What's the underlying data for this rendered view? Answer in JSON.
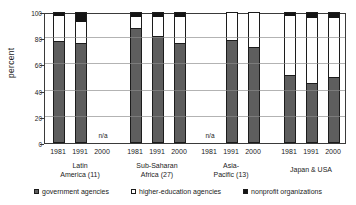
{
  "chart_data": {
    "type": "bar",
    "stacked": true,
    "ylabel": "percent",
    "ylim": [
      0,
      100
    ],
    "yticks": [
      0,
      20,
      40,
      60,
      80,
      100
    ],
    "grid": "horizontal",
    "legend_position": "bottom",
    "na_label": "n/a",
    "legend": [
      {
        "name": "government agencies",
        "color": "#5e5e5e"
      },
      {
        "name": "higher-education agencies",
        "color": "#ffffff"
      },
      {
        "name": "nonprofit organizations",
        "color": "#141414"
      }
    ],
    "series_order": [
      "government agencies",
      "higher-education agencies",
      "nonprofit organizations"
    ],
    "groups": [
      {
        "label_lines": [
          "Latin",
          "America (11)"
        ],
        "bars": [
          {
            "year": "1981",
            "government": 78,
            "higher_education": 20,
            "nonprofit": 2
          },
          {
            "year": "1991",
            "government": 76,
            "higher_education": 17,
            "nonprofit": 7
          },
          {
            "year": "2000",
            "na": true
          }
        ]
      },
      {
        "label_lines": [
          "Sub-Saharan",
          "Africa (27)"
        ],
        "bars": [
          {
            "year": "1981",
            "government": 88,
            "higher_education": 9,
            "nonprofit": 3
          },
          {
            "year": "1991",
            "government": 82,
            "higher_education": 15,
            "nonprofit": 3
          },
          {
            "year": "2000",
            "government": 76,
            "higher_education": 21,
            "nonprofit": 3
          }
        ]
      },
      {
        "label_lines": [
          "Asia-",
          "Pacific (13)"
        ],
        "bars": [
          {
            "year": "1981",
            "na": true
          },
          {
            "year": "1991",
            "government": 79,
            "higher_education": 21,
            "nonprofit": 0
          },
          {
            "year": "2000",
            "government": 73,
            "higher_education": 27,
            "nonprofit": 0
          }
        ]
      },
      {
        "label_lines": [
          "Japan & USA"
        ],
        "bars": [
          {
            "year": "1981",
            "government": 52,
            "higher_education": 46,
            "nonprofit": 2
          },
          {
            "year": "1991",
            "government": 46,
            "higher_education": 50,
            "nonprofit": 4
          },
          {
            "year": "2000",
            "government": 50,
            "higher_education": 46,
            "nonprofit": 4
          }
        ]
      }
    ]
  }
}
